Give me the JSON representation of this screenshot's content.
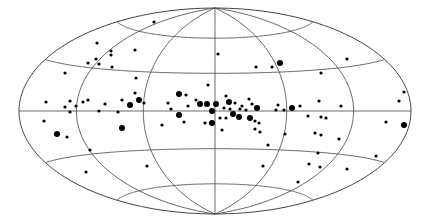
{
  "chart_data": {
    "type": "scatter",
    "title": "",
    "projection": "Hammer-Aitoff all-sky (galactic coordinates)",
    "xlabel": "",
    "ylabel": "",
    "grid": true,
    "graticule": {
      "longitude_step_deg": 60,
      "latitude_step_deg": 30
    },
    "legend": null,
    "ellipse_px": {
      "cx": 215,
      "cy": 111,
      "rx": 196,
      "ry": 103
    },
    "marker_sizes": {
      "small": 1.6,
      "large": 3.0
    },
    "points_px": [
      {
        "x": 154,
        "y": 22,
        "s": "small"
      },
      {
        "x": 97,
        "y": 43,
        "s": "small"
      },
      {
        "x": 135,
        "y": 50,
        "s": "small"
      },
      {
        "x": 111,
        "y": 51,
        "s": "small"
      },
      {
        "x": 111,
        "y": 55,
        "s": "small"
      },
      {
        "x": 96,
        "y": 59,
        "s": "small"
      },
      {
        "x": 88,
        "y": 63,
        "s": "small"
      },
      {
        "x": 99,
        "y": 64,
        "s": "small"
      },
      {
        "x": 112,
        "y": 67,
        "s": "small"
      },
      {
        "x": 65,
        "y": 73,
        "s": "small"
      },
      {
        "x": 136,
        "y": 78,
        "s": "small"
      },
      {
        "x": 218,
        "y": 54,
        "s": "small"
      },
      {
        "x": 256,
        "y": 67,
        "s": "small"
      },
      {
        "x": 272,
        "y": 67,
        "s": "small"
      },
      {
        "x": 280,
        "y": 63,
        "s": "large"
      },
      {
        "x": 347,
        "y": 59,
        "s": "small"
      },
      {
        "x": 321,
        "y": 73,
        "s": "small"
      },
      {
        "x": 208,
        "y": 85,
        "s": "small"
      },
      {
        "x": 135,
        "y": 93,
        "s": "small"
      },
      {
        "x": 404,
        "y": 92,
        "s": "small"
      },
      {
        "x": 399,
        "y": 101,
        "s": "small"
      },
      {
        "x": 46,
        "y": 102,
        "s": "small"
      },
      {
        "x": 70,
        "y": 101,
        "s": "small"
      },
      {
        "x": 83,
        "y": 102,
        "s": "small"
      },
      {
        "x": 88,
        "y": 100,
        "s": "small"
      },
      {
        "x": 122,
        "y": 100,
        "s": "small"
      },
      {
        "x": 139,
        "y": 100,
        "s": "large"
      },
      {
        "x": 130,
        "y": 105,
        "s": "large"
      },
      {
        "x": 144,
        "y": 103,
        "s": "small"
      },
      {
        "x": 65,
        "y": 107,
        "s": "small"
      },
      {
        "x": 76,
        "y": 106,
        "s": "small"
      },
      {
        "x": 70,
        "y": 112,
        "s": "small"
      },
      {
        "x": 99,
        "y": 111,
        "s": "small"
      },
      {
        "x": 105,
        "y": 104,
        "s": "small"
      },
      {
        "x": 118,
        "y": 112,
        "s": "small"
      },
      {
        "x": 179,
        "y": 94,
        "s": "large"
      },
      {
        "x": 186,
        "y": 95,
        "s": "small"
      },
      {
        "x": 168,
        "y": 103,
        "s": "small"
      },
      {
        "x": 188,
        "y": 106,
        "s": "small"
      },
      {
        "x": 196,
        "y": 100,
        "s": "small"
      },
      {
        "x": 200,
        "y": 104,
        "s": "large"
      },
      {
        "x": 207,
        "y": 104,
        "s": "large"
      },
      {
        "x": 216,
        "y": 104,
        "s": "large"
      },
      {
        "x": 212,
        "y": 111,
        "s": "large"
      },
      {
        "x": 226,
        "y": 96,
        "s": "small"
      },
      {
        "x": 229,
        "y": 102,
        "s": "large"
      },
      {
        "x": 235,
        "y": 103,
        "s": "small"
      },
      {
        "x": 224,
        "y": 108,
        "s": "small"
      },
      {
        "x": 230,
        "y": 109,
        "s": "small"
      },
      {
        "x": 242,
        "y": 106,
        "s": "small"
      },
      {
        "x": 240,
        "y": 109,
        "s": "small"
      },
      {
        "x": 249,
        "y": 99,
        "s": "small"
      },
      {
        "x": 252,
        "y": 104,
        "s": "small"
      },
      {
        "x": 257,
        "y": 108,
        "s": "large"
      },
      {
        "x": 246,
        "y": 110,
        "s": "small"
      },
      {
        "x": 179,
        "y": 115,
        "s": "large"
      },
      {
        "x": 171,
        "y": 109,
        "s": "small"
      },
      {
        "x": 184,
        "y": 122,
        "s": "small"
      },
      {
        "x": 162,
        "y": 125,
        "s": "small"
      },
      {
        "x": 205,
        "y": 123,
        "s": "small"
      },
      {
        "x": 212,
        "y": 123,
        "s": "large"
      },
      {
        "x": 220,
        "y": 118,
        "s": "small"
      },
      {
        "x": 226,
        "y": 118,
        "s": "small"
      },
      {
        "x": 233,
        "y": 114,
        "s": "large"
      },
      {
        "x": 239,
        "y": 117,
        "s": "large"
      },
      {
        "x": 250,
        "y": 118,
        "s": "large"
      },
      {
        "x": 255,
        "y": 121,
        "s": "small"
      },
      {
        "x": 259,
        "y": 123,
        "s": "small"
      },
      {
        "x": 255,
        "y": 129,
        "s": "small"
      },
      {
        "x": 260,
        "y": 132,
        "s": "small"
      },
      {
        "x": 222,
        "y": 130,
        "s": "small"
      },
      {
        "x": 278,
        "y": 105,
        "s": "small"
      },
      {
        "x": 276,
        "y": 110,
        "s": "small"
      },
      {
        "x": 284,
        "y": 110,
        "s": "small"
      },
      {
        "x": 292,
        "y": 108,
        "s": "large"
      },
      {
        "x": 285,
        "y": 134,
        "s": "small"
      },
      {
        "x": 300,
        "y": 106,
        "s": "small"
      },
      {
        "x": 319,
        "y": 101,
        "s": "small"
      },
      {
        "x": 341,
        "y": 106,
        "s": "small"
      },
      {
        "x": 308,
        "y": 116,
        "s": "small"
      },
      {
        "x": 321,
        "y": 117,
        "s": "small"
      },
      {
        "x": 326,
        "y": 118,
        "s": "small"
      },
      {
        "x": 315,
        "y": 133,
        "s": "small"
      },
      {
        "x": 321,
        "y": 135,
        "s": "small"
      },
      {
        "x": 339,
        "y": 139,
        "s": "small"
      },
      {
        "x": 386,
        "y": 122,
        "s": "small"
      },
      {
        "x": 404,
        "y": 125,
        "s": "large"
      },
      {
        "x": 268,
        "y": 145,
        "s": "small"
      },
      {
        "x": 263,
        "y": 166,
        "s": "small"
      },
      {
        "x": 318,
        "y": 153,
        "s": "small"
      },
      {
        "x": 309,
        "y": 164,
        "s": "small"
      },
      {
        "x": 320,
        "y": 167,
        "s": "small"
      },
      {
        "x": 347,
        "y": 169,
        "s": "small"
      },
      {
        "x": 376,
        "y": 156,
        "s": "small"
      },
      {
        "x": 298,
        "y": 182,
        "s": "small"
      },
      {
        "x": 44,
        "y": 121,
        "s": "small"
      },
      {
        "x": 57,
        "y": 134,
        "s": "large"
      },
      {
        "x": 67,
        "y": 137,
        "s": "small"
      },
      {
        "x": 122,
        "y": 128,
        "s": "large"
      },
      {
        "x": 90,
        "y": 150,
        "s": "small"
      },
      {
        "x": 86,
        "y": 172,
        "s": "small"
      },
      {
        "x": 147,
        "y": 166,
        "s": "small"
      }
    ]
  }
}
